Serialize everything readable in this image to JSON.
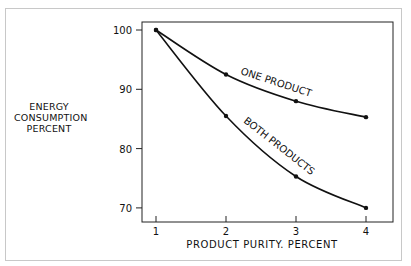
{
  "chart_data": {
    "type": "line",
    "title": "",
    "xlabel": "PRODUCT PURITY, PERCENT",
    "ylabel": "ENERGY CONSUMPTION PERCENT",
    "x": [
      1,
      2,
      3,
      4
    ],
    "x_ticks": [
      "1",
      "2",
      "3",
      "4"
    ],
    "y_ticks": [
      "70",
      "80",
      "90",
      "100"
    ],
    "ylim": [
      68,
      101.5
    ],
    "xlim": [
      0.8,
      4.4
    ],
    "grid": false,
    "legend": "inline labels on curves",
    "series": [
      {
        "name": "ONE PRODUCT",
        "values": [
          100,
          92.5,
          88,
          85.3
        ]
      },
      {
        "name": "BOTH PRODUCTS",
        "values": [
          100,
          85.5,
          75.3,
          70
        ]
      }
    ]
  },
  "labels": {
    "ylabel_lines": [
      "ENERGY",
      "CONSUMPTION",
      "PERCENT"
    ],
    "xlabel": "PRODUCT PURITY. PERCENT",
    "one_product": "ONE PRODUCT",
    "both_products": "BOTH PRODUCTS"
  }
}
